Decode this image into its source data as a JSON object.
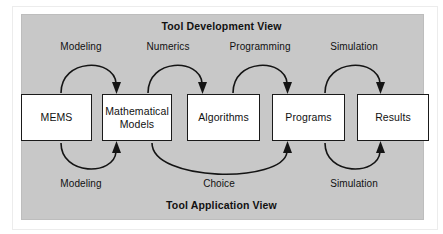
{
  "diagram": {
    "titles": {
      "top": "Tool Development View",
      "bottom": "Tool Application View"
    },
    "colors": {
      "panel_background": "#c8c8c8",
      "box_fill": "#ffffff",
      "box_border": "#1a1a1a",
      "text": "#111111",
      "arrow": "#141414"
    },
    "nodes": [
      {
        "id": "mems",
        "label": "MEMS"
      },
      {
        "id": "mathematical-models",
        "label": "Mathematical\nModels",
        "line1": "Mathematical",
        "line2": "Models"
      },
      {
        "id": "algorithms",
        "label": "Algorithms"
      },
      {
        "id": "programs",
        "label": "Programs"
      },
      {
        "id": "results",
        "label": "Results"
      }
    ],
    "top_arrows": [
      {
        "id": "modeling-top",
        "label": "Modeling",
        "from": "mems",
        "to": "mathematical-models"
      },
      {
        "id": "numerics",
        "label": "Numerics",
        "from": "mathematical-models",
        "to": "algorithms"
      },
      {
        "id": "programming",
        "label": "Programming",
        "from": "algorithms",
        "to": "programs"
      },
      {
        "id": "simulation-top",
        "label": "Simulation",
        "from": "programs",
        "to": "results"
      }
    ],
    "bottom_arrows": [
      {
        "id": "modeling-bottom",
        "label": "Modeling",
        "from": "mems",
        "to": "mathematical-models"
      },
      {
        "id": "choice",
        "label": "Choice",
        "from": "mathematical-models",
        "to": "programs"
      },
      {
        "id": "simulation-bottom",
        "label": "Simulation",
        "from": "programs",
        "to": "results"
      }
    ]
  }
}
